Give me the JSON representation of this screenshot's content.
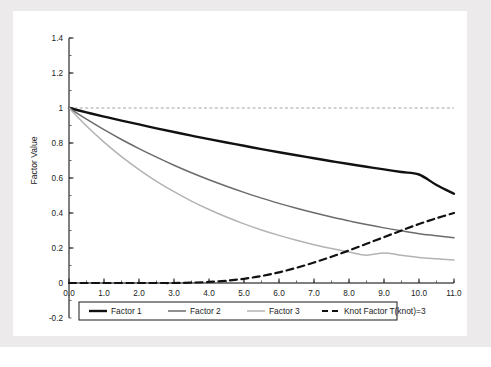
{
  "figure": {
    "background_color": "#eceaea",
    "panel_color": "#ffffff",
    "caption_ghost": "(a) Exponential loading factors"
  },
  "chart_data": {
    "type": "line",
    "title": "",
    "xlabel": "Term to Maturity",
    "ylabel": "Factor Value",
    "xlim": [
      0.0,
      11.0
    ],
    "ylim": [
      -0.2,
      1.4
    ],
    "grid": false,
    "legend_position": "below-axis",
    "x_ticks": [
      "0.0",
      "1.0",
      "2.0",
      "3.0",
      "4.0",
      "5.0",
      "6.0",
      "7.0",
      "8.0",
      "9.0",
      "10.0",
      "11.0"
    ],
    "x_tick_values": [
      0,
      1,
      2,
      3,
      4,
      5,
      6,
      7,
      8,
      9,
      10,
      11
    ],
    "x_minor_step": 0.5,
    "y_ticks": [
      "-0.2",
      "0",
      "0.2",
      "0.4",
      "0.6",
      "0.8",
      "1",
      "1.2",
      "1.4"
    ],
    "y_tick_values": [
      -0.2,
      0,
      0.2,
      0.4,
      0.6,
      0.8,
      1.0,
      1.2,
      1.4
    ],
    "y_minor_step": 0.1,
    "reference_line": {
      "y": 1.0,
      "style": "dashed",
      "color": "#9a9a9a"
    },
    "x": [
      0,
      0.5,
      1,
      1.5,
      2,
      2.5,
      3,
      3.5,
      4,
      4.5,
      5,
      5.5,
      6,
      6.5,
      7,
      7.5,
      8,
      8.5,
      9,
      9.5,
      10,
      10.5,
      11
    ],
    "series": [
      {
        "name": "Factor 1",
        "color": "#111111",
        "width": 2.4,
        "dash": "solid",
        "values": [
          1.0,
          0.975,
          0.951,
          0.928,
          0.906,
          0.884,
          0.863,
          0.842,
          0.822,
          0.803,
          0.784,
          0.765,
          0.747,
          0.73,
          0.713,
          0.696,
          0.68,
          0.664,
          0.649,
          0.634,
          0.62,
          0.56,
          0.51
        ]
      },
      {
        "name": "Factor 2",
        "color": "#6b6b6b",
        "width": 1.5,
        "dash": "solid",
        "values": [
          1.0,
          0.936,
          0.876,
          0.82,
          0.768,
          0.719,
          0.673,
          0.63,
          0.59,
          0.553,
          0.518,
          0.485,
          0.455,
          0.427,
          0.401,
          0.377,
          0.355,
          0.334,
          0.315,
          0.298,
          0.282,
          0.27,
          0.258
        ]
      },
      {
        "name": "Factor 3",
        "color": "#b3b3b3",
        "width": 1.5,
        "dash": "solid",
        "values": [
          1.0,
          0.897,
          0.805,
          0.722,
          0.648,
          0.581,
          0.522,
          0.468,
          0.42,
          0.377,
          0.338,
          0.303,
          0.272,
          0.244,
          0.219,
          0.197,
          0.177,
          0.159,
          0.172,
          0.158,
          0.146,
          0.138,
          0.131
        ]
      },
      {
        "name": "Knot Factor T(knot)=3",
        "color": "#111111",
        "width": 2.2,
        "dash": "dashed",
        "values": [
          0.0,
          0.0,
          0.0,
          0.0,
          0.0,
          0.0,
          0.0,
          0.002,
          0.006,
          0.013,
          0.024,
          0.04,
          0.061,
          0.087,
          0.117,
          0.15,
          0.186,
          0.224,
          0.262,
          0.3,
          0.337,
          0.37,
          0.4
        ]
      }
    ],
    "legend": [
      {
        "label": "Factor 1",
        "color": "#111111",
        "dash": "solid",
        "width": 2.4
      },
      {
        "label": "Factor 2",
        "color": "#6b6b6b",
        "dash": "solid",
        "width": 1.5
      },
      {
        "label": "Factor 3",
        "color": "#b3b3b3",
        "dash": "solid",
        "width": 1.5
      },
      {
        "label": "Knot Factor T(knot)=3",
        "color": "#111111",
        "dash": "dashed",
        "width": 2.2
      }
    ]
  }
}
